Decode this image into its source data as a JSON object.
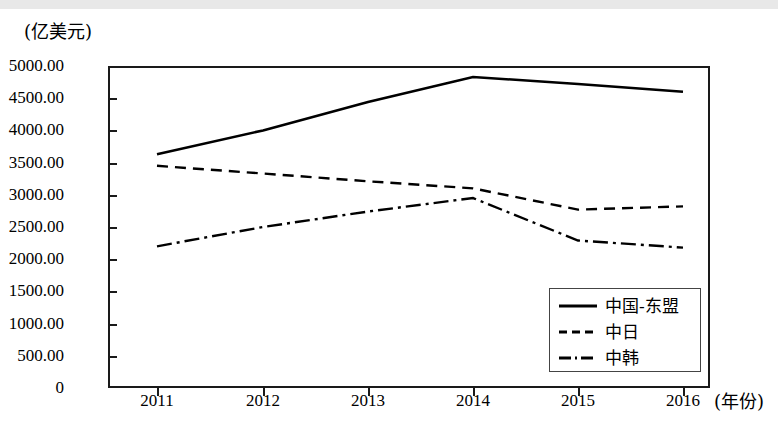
{
  "chart_data": {
    "type": "line",
    "title": "",
    "subtitle": "",
    "ylabel": "(亿美元)",
    "xlabel": "(年份)",
    "categories": [
      "2011",
      "2012",
      "2013",
      "2014",
      "2015",
      "2016"
    ],
    "x": [
      2011,
      2012,
      2013,
      2014,
      2015,
      2016
    ],
    "ylim": [
      0,
      5000
    ],
    "y_ticks": [
      "5000.00",
      "4500.00",
      "4000.00",
      "3500.00",
      "3000.00",
      "2500.00",
      "2000.00",
      "1500.00",
      "1000.00",
      "500.00",
      "0"
    ],
    "y_tick_values": [
      5000,
      4500,
      4000,
      3500,
      3000,
      2500,
      2000,
      1500,
      1000,
      500,
      0
    ],
    "grid": false,
    "legend_position": "lower-right",
    "series": [
      {
        "name": "中国-东盟",
        "style": "solid",
        "color": "#000000",
        "values": [
          3630,
          4000,
          4440,
          4830,
          4720,
          4600
        ]
      },
      {
        "name": "中日",
        "style": "dashed",
        "color": "#000000",
        "values": [
          3450,
          3330,
          3210,
          3100,
          2770,
          2820
        ]
      },
      {
        "name": "中韩",
        "style": "dash-dot",
        "color": "#000000",
        "values": [
          2200,
          2500,
          2740,
          2950,
          2290,
          2180
        ]
      }
    ]
  }
}
